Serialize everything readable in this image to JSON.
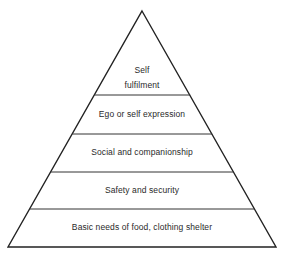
{
  "diagram": {
    "type": "pyramid",
    "stroke_color": "#222222",
    "background": "#ffffff",
    "levels": [
      {
        "label_line1": "Self",
        "label_line2": "fulfilment"
      },
      {
        "label": "Ego or self expression"
      },
      {
        "label": "Social and companionship"
      },
      {
        "label": "Safety and security"
      },
      {
        "label": "Basic needs of food, clothing shelter"
      }
    ]
  }
}
